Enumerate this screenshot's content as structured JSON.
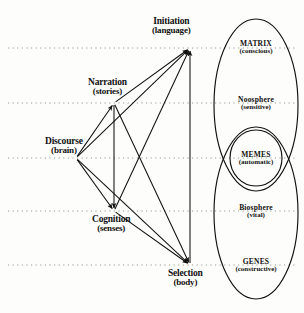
{
  "diagram": {
    "type": "node-arrow-venn",
    "ink_color": "#111111",
    "guide_color": "#9a9a9a",
    "background": "#fdfdfb",
    "nodes": [
      {
        "id": "initiation",
        "line1": "Initiation",
        "line2": "(language)",
        "x": 190,
        "y": 48,
        "label_x": 152,
        "label_y": 16
      },
      {
        "id": "narration",
        "line1": "Narration",
        "line2": "(stories)",
        "x": 114,
        "y": 103,
        "label_x": 88,
        "label_y": 77
      },
      {
        "id": "discourse",
        "line1": "Discourse",
        "line2": "(brain)",
        "x": 76,
        "y": 158,
        "label_x": 45,
        "label_y": 136
      },
      {
        "id": "cognition",
        "line1": "Cognition",
        "line2": "(senses)",
        "x": 114,
        "y": 211,
        "label_x": 92,
        "label_y": 214
      },
      {
        "id": "selection",
        "line1": "Selection",
        "line2": "(body)",
        "x": 190,
        "y": 265,
        "label_x": 168,
        "label_y": 268
      }
    ],
    "guide_lines": [
      {
        "id": "guide-initiation",
        "y": 48
      },
      {
        "id": "guide-narration",
        "y": 103
      },
      {
        "id": "guide-discourse",
        "y": 158
      },
      {
        "id": "guide-cognition",
        "y": 211
      },
      {
        "id": "guide-selection",
        "y": 265
      }
    ],
    "edges": [
      {
        "id": "discourse-to-initiation",
        "from": "discourse",
        "to": "initiation"
      },
      {
        "id": "discourse-to-narration",
        "from": "discourse",
        "to": "narration"
      },
      {
        "id": "discourse-to-cognition",
        "from": "discourse",
        "to": "cognition"
      },
      {
        "id": "discourse-to-selection",
        "from": "discourse",
        "to": "selection"
      },
      {
        "id": "narration-to-initiation",
        "from": "narration",
        "to": "initiation"
      },
      {
        "id": "narration-to-selection",
        "from": "narration",
        "to": "selection"
      },
      {
        "id": "cognition-to-initiation",
        "from": "cognition",
        "to": "initiation"
      },
      {
        "id": "cognition-to-selection",
        "from": "cognition",
        "to": "selection"
      },
      {
        "id": "narration-cognition-down",
        "from": "narration",
        "to": "cognition"
      },
      {
        "id": "selection-initiation-up",
        "from": "selection",
        "to": "initiation"
      }
    ],
    "ellipses": [
      {
        "id": "upper-sphere",
        "cx": 256,
        "cy": 105,
        "rx": 42,
        "ry": 86
      },
      {
        "id": "lower-sphere",
        "cx": 256,
        "cy": 213,
        "rx": 42,
        "ry": 86
      },
      {
        "id": "memes-overlap",
        "cx": 256,
        "cy": 158,
        "rx": 26,
        "ry": 28
      }
    ],
    "ellipse_labels": [
      {
        "id": "matrix",
        "line1": "MATRIX",
        "line2": "(conscious)",
        "x": 256,
        "y": 40
      },
      {
        "id": "noosphere",
        "line1": "Noosphere",
        "line2": "(sensitive)",
        "x": 256,
        "y": 96
      },
      {
        "id": "memes",
        "line1": "MEMES",
        "line2": "(automatic)",
        "x": 256,
        "y": 151
      },
      {
        "id": "biosphere",
        "line1": "Biosphere",
        "line2": "(vital)",
        "x": 256,
        "y": 204
      },
      {
        "id": "genes",
        "line1": "GENES",
        "line2": "(constructive)",
        "x": 256,
        "y": 258
      }
    ]
  }
}
